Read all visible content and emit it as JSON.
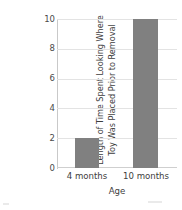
{
  "chart_data": {
    "type": "bar",
    "title": "",
    "categories": [
      "4 months",
      "10 months"
    ],
    "values": [
      2,
      10
    ],
    "xlabel": "Age",
    "ylabel": "Length of Time Spent Looking Where Toy Was Placed Prior to Removal",
    "ylabel_lines": [
      "Length of Time Spent Looking Where",
      "Toy Was Placed Prior to Removal"
    ],
    "ylim": [
      0,
      10
    ],
    "ytick_labels": [
      "0",
      "2",
      "4",
      "6",
      "8",
      "10"
    ],
    "ytick_values": [
      0,
      2,
      4,
      6,
      8,
      10
    ],
    "grid": true,
    "legend": "none",
    "bar_color": "#808080",
    "gridline_color": "#e3e3e3",
    "axis_color": "#c9c9c9",
    "text_color": "#3d3d3d",
    "background_color": "#ffffff"
  }
}
